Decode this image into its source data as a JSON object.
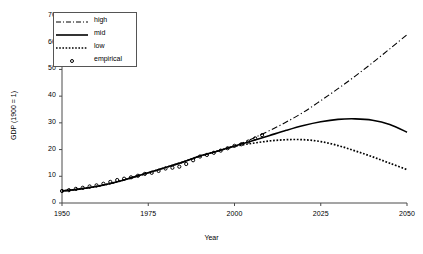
{
  "chart_data": {
    "type": "line",
    "title": "",
    "xlabel": "Year",
    "ylabel": "GDP (1900 = 1)",
    "xlim": [
      1950,
      2050
    ],
    "ylim": [
      0,
      70
    ],
    "xticks": [
      1950,
      1975,
      2000,
      2025,
      2050
    ],
    "yticks": [
      0,
      10,
      20,
      30,
      40,
      50,
      60,
      70
    ],
    "grid": false,
    "legend_position": "top-left",
    "series": [
      {
        "name": "high",
        "style": "dash-dot",
        "x": [
          1950,
          1955,
          1960,
          1965,
          1970,
          1975,
          1980,
          1985,
          1990,
          1995,
          2000,
          2005,
          2010,
          2015,
          2020,
          2025,
          2030,
          2035,
          2040,
          2045,
          2050
        ],
        "values": [
          4.5,
          5.2,
          6.2,
          7.6,
          9.4,
          11.3,
          13.3,
          15.3,
          17.6,
          19.4,
          21.3,
          24.0,
          27.0,
          30.3,
          34.0,
          38.3,
          42.8,
          47.5,
          52.5,
          57.7,
          63.0
        ]
      },
      {
        "name": "mid",
        "style": "solid",
        "x": [
          1950,
          1955,
          1960,
          1965,
          1970,
          1975,
          1980,
          1985,
          1990,
          1995,
          2000,
          2005,
          2010,
          2015,
          2020,
          2025,
          2030,
          2035,
          2040,
          2045,
          2050
        ],
        "values": [
          4.5,
          5.2,
          6.2,
          7.6,
          9.4,
          11.3,
          13.3,
          15.3,
          17.6,
          19.4,
          21.3,
          23.2,
          25.2,
          27.2,
          29.0,
          30.4,
          31.3,
          31.5,
          31.0,
          29.4,
          26.5
        ]
      },
      {
        "name": "low",
        "style": "dotted",
        "x": [
          1950,
          1955,
          1960,
          1965,
          1970,
          1975,
          1980,
          1985,
          1990,
          1995,
          2000,
          2005,
          2010,
          2015,
          2020,
          2025,
          2030,
          2035,
          2040,
          2045,
          2050
        ],
        "values": [
          4.5,
          5.2,
          6.2,
          7.6,
          9.4,
          11.3,
          13.3,
          15.3,
          17.6,
          19.4,
          21.2,
          22.3,
          23.2,
          23.7,
          23.7,
          23.0,
          21.5,
          19.5,
          17.3,
          14.9,
          12.5
        ]
      },
      {
        "name": "empirical",
        "style": "markers",
        "x": [
          1950,
          1952,
          1954,
          1956,
          1958,
          1960,
          1962,
          1964,
          1966,
          1968,
          1970,
          1972,
          1974,
          1976,
          1978,
          1980,
          1982,
          1984,
          1986,
          1988,
          1990,
          1992,
          1994,
          1996,
          1998,
          2000,
          2002,
          2004,
          2006,
          2008
        ],
        "values": [
          4.5,
          4.8,
          5.3,
          5.7,
          6.2,
          6.6,
          7.2,
          7.9,
          8.6,
          9.1,
          9.6,
          10.2,
          10.9,
          11.3,
          12.0,
          12.9,
          13.2,
          13.6,
          14.6,
          16.0,
          17.4,
          18.0,
          18.8,
          19.6,
          20.5,
          21.4,
          22.0,
          23.0,
          24.2,
          25.4
        ]
      }
    ]
  },
  "legend": {
    "items": [
      {
        "label": "high"
      },
      {
        "label": "mid"
      },
      {
        "label": "low"
      },
      {
        "label": "empirical"
      }
    ]
  }
}
